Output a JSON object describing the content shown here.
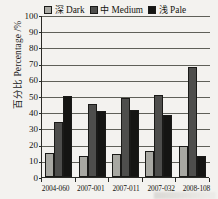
{
  "chart_data": {
    "type": "bar",
    "title": "",
    "xlabel": "",
    "ylabel": "百分比 Percentage /%",
    "ylim": [
      0,
      100
    ],
    "ytick_step": 10,
    "yticks": [
      100,
      90,
      80,
      70,
      60,
      50,
      40,
      30,
      20,
      10,
      0
    ],
    "grid": true,
    "legend_position": "top",
    "categories": [
      "2004-060",
      "2007-001",
      "2007-011",
      "2007-032",
      "2008-108"
    ],
    "series": [
      {
        "name": "深 Dark",
        "color": "#a8a8a2",
        "values": [
          15,
          13,
          14,
          16,
          19
        ]
      },
      {
        "name": "中 Medium",
        "color": "#4e4e4c",
        "values": [
          34,
          45,
          48.5,
          50.5,
          68
        ]
      },
      {
        "name": "浅 Pale",
        "color": "#151513",
        "values": [
          50,
          41,
          41.5,
          38,
          13
        ]
      }
    ]
  },
  "legend": {
    "items": [
      {
        "cjk": "深",
        "latin": "Dark",
        "color": "#a8a8a2"
      },
      {
        "cjk": "中",
        "latin": "Medium",
        "color": "#4e4e4c"
      },
      {
        "cjk": "浅",
        "latin": "Pale",
        "color": "#151513"
      }
    ]
  }
}
